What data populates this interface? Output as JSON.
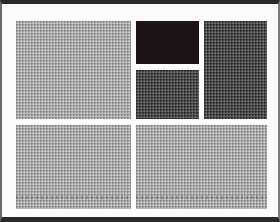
{
  "diagram": {
    "type": "block-layout",
    "frame": {
      "background": "#fbfbfb",
      "border_color": "#2a2a2a"
    },
    "blocks": [
      {
        "id": "top-left",
        "tone": "light",
        "color": "#a9a9a9",
        "x": 14,
        "y": 17,
        "w": 115,
        "h": 98
      },
      {
        "id": "top-middle-upper",
        "tone": "black",
        "color": "#1c1316",
        "x": 134,
        "y": 17,
        "w": 63,
        "h": 43
      },
      {
        "id": "top-middle-lower",
        "tone": "dark",
        "color": "#4a4a4a",
        "x": 134,
        "y": 66,
        "w": 63,
        "h": 49
      },
      {
        "id": "top-right",
        "tone": "dark",
        "color": "#4a4a4a",
        "x": 202,
        "y": 17,
        "w": 63,
        "h": 98
      },
      {
        "id": "bottom-left",
        "tone": "light",
        "color": "#a9a9a9",
        "x": 14,
        "y": 121,
        "w": 115,
        "h": 84
      },
      {
        "id": "bottom-right",
        "tone": "light",
        "color": "#a9a9a9",
        "x": 134,
        "y": 121,
        "w": 131,
        "h": 84
      }
    ]
  }
}
